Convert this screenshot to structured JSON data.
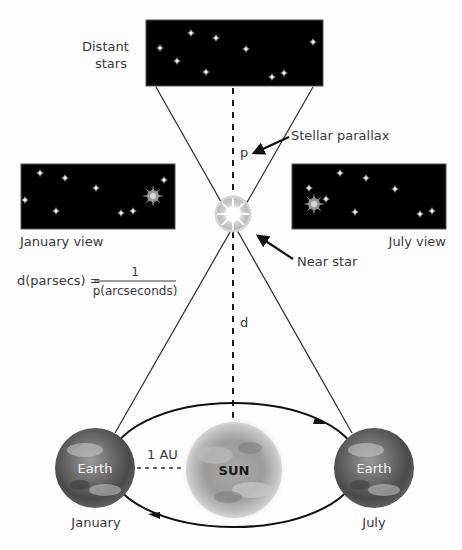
{
  "figure": {
    "colors": {
      "background": "#fdfdfd",
      "sky": "#000000",
      "line": "#2a2a2a",
      "label": "#3a3a3a",
      "star": "#ffffff"
    }
  },
  "labels": {
    "distant_stars_line1": "Distant",
    "distant_stars_line2": "stars",
    "stellar_parallax": "Stellar parallax",
    "p": "p",
    "january_view": "January view",
    "july_view": "July view",
    "near_star": "Near star",
    "d": "d",
    "one_au": "1 AU",
    "earth_left": "Earth",
    "earth_right": "Earth",
    "sun": "SUN",
    "january": "January",
    "july": "July"
  },
  "formula": {
    "lhs": "d(parsecs) =",
    "numerator": "1",
    "denominator": "p(arcseconds)"
  },
  "panels": {
    "distant": {
      "stars": [
        [
          160,
          48
        ],
        [
          191,
          33
        ],
        [
          216,
          38
        ],
        [
          177,
          61
        ],
        [
          246,
          49
        ],
        [
          206,
          72
        ],
        [
          313,
          42
        ],
        [
          272,
          77
        ],
        [
          284,
          73
        ]
      ]
    },
    "january": {
      "stars": [
        [
          40,
          173
        ],
        [
          65,
          178
        ],
        [
          96,
          188
        ],
        [
          25,
          200
        ],
        [
          56,
          211
        ],
        [
          162,
          180
        ],
        [
          121,
          213
        ],
        [
          133,
          211
        ]
      ],
      "near_star": [
        153,
        196
      ]
    },
    "july": {
      "stars": [
        [
          340,
          173
        ],
        [
          365,
          178
        ],
        [
          390,
          188
        ],
        [
          309,
          188
        ],
        [
          323,
          199
        ],
        [
          355,
          212
        ],
        [
          420,
          214
        ],
        [
          432,
          212
        ]
      ],
      "near_star": [
        315,
        204
      ]
    }
  }
}
